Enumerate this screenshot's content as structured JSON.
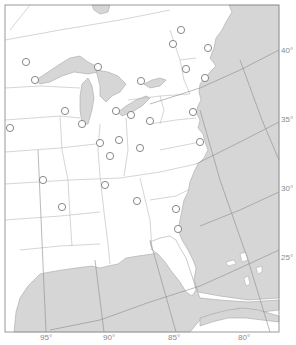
{
  "map": {
    "title": "Eastern United States outline map",
    "colors": {
      "land": "#ffffff",
      "water": "#d6d6d6",
      "border": "#b8b8b8",
      "grid": "#8c8c8c",
      "frame": "#9a9a9a",
      "label": "#8a8a8a"
    },
    "latitude_labels": [
      "40°",
      "35°",
      "30°",
      "25°"
    ],
    "longitude_labels": [
      "95°",
      "90°",
      "85°",
      "80°"
    ],
    "cities": [
      {
        "id": "city-1",
        "x": 181,
        "y": 30
      },
      {
        "id": "city-2",
        "x": 208,
        "y": 48
      },
      {
        "id": "city-3",
        "x": 173,
        "y": 44
      },
      {
        "id": "city-4",
        "x": 26,
        "y": 62
      },
      {
        "id": "city-5",
        "x": 98,
        "y": 67
      },
      {
        "id": "city-6",
        "x": 35,
        "y": 80
      },
      {
        "id": "city-7",
        "x": 141,
        "y": 81
      },
      {
        "id": "city-8",
        "x": 186,
        "y": 69
      },
      {
        "id": "city-9",
        "x": 205,
        "y": 78
      },
      {
        "id": "city-10",
        "x": 65,
        "y": 111
      },
      {
        "id": "city-11",
        "x": 116,
        "y": 111
      },
      {
        "id": "city-12",
        "x": 131,
        "y": 115
      },
      {
        "id": "city-13",
        "x": 82,
        "y": 124
      },
      {
        "id": "city-14",
        "x": 193,
        "y": 112
      },
      {
        "id": "city-15",
        "x": 10,
        "y": 128
      },
      {
        "id": "city-16",
        "x": 150,
        "y": 121
      },
      {
        "id": "city-17",
        "x": 100,
        "y": 143
      },
      {
        "id": "city-18",
        "x": 119,
        "y": 140
      },
      {
        "id": "city-19",
        "x": 110,
        "y": 156
      },
      {
        "id": "city-20",
        "x": 140,
        "y": 148
      },
      {
        "id": "city-21",
        "x": 200,
        "y": 142
      },
      {
        "id": "city-22",
        "x": 43,
        "y": 180
      },
      {
        "id": "city-23",
        "x": 105,
        "y": 185
      },
      {
        "id": "city-24",
        "x": 137,
        "y": 201
      },
      {
        "id": "city-25",
        "x": 62,
        "y": 207
      },
      {
        "id": "city-26",
        "x": 176,
        "y": 209
      },
      {
        "id": "city-27",
        "x": 178,
        "y": 229
      }
    ]
  }
}
